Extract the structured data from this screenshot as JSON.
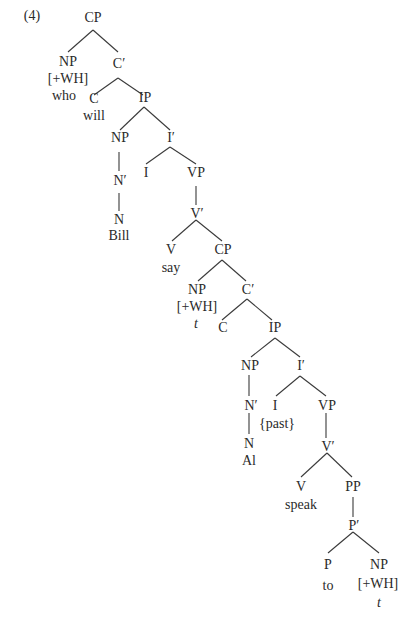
{
  "example_number": "(4)",
  "nodes": {
    "cp1": "CP",
    "np1": "NP",
    "np1_feat": "[+WH]",
    "np1_word": "who",
    "c1bar": "C′",
    "c1": "C",
    "c1_word": "will",
    "ip1": "IP",
    "np2": "NP",
    "n2bar": "N′",
    "n2": "N",
    "n2_word": "Bill",
    "i1bar": "I′",
    "i1": "I",
    "vp1": "VP",
    "v1bar": "V′",
    "v1": "V",
    "v1_word": "say",
    "cp2": "CP",
    "np3": "NP",
    "np3_feat": "[+WH]",
    "np3_word": "t",
    "c2bar": "C′",
    "c2": "C",
    "ip2": "IP",
    "np4": "NP",
    "n4bar": "N′",
    "n4": "N",
    "n4_word": "Al",
    "i2bar": "I′",
    "i2": "I",
    "i2_word": "{past}",
    "vp2": "VP",
    "v2bar": "V′",
    "v2": "V",
    "v2_word": "speak",
    "pp": "PP",
    "pbar": "P′",
    "p": "P",
    "p_word": "to",
    "np5": "NP",
    "np5_feat": "[+WH]",
    "np5_word": "t"
  }
}
